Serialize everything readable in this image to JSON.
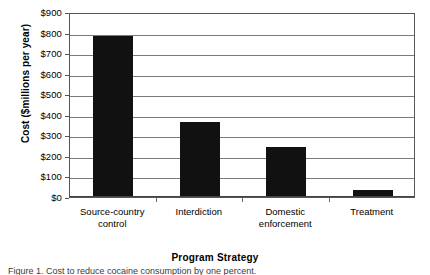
{
  "chart_data": {
    "type": "bar",
    "title": "",
    "xlabel": "Program Strategy",
    "ylabel": "Cost ($millions per year)",
    "categories": [
      "Source-country\ncontrol",
      "Interdiction",
      "Domestic\nenforcement",
      "Treatment"
    ],
    "category_labels_flat": [
      "Source-country control",
      "Interdiction",
      "Domestic enforcement",
      "Treatment"
    ],
    "values": [
      785,
      365,
      245,
      35
    ],
    "ylim": [
      0,
      900
    ],
    "ytick_step": 100,
    "ytick_labels": [
      "$0",
      "$100",
      "$200",
      "$300",
      "$400",
      "$500",
      "$600",
      "$700",
      "$800",
      "$900"
    ],
    "ytick_values": [
      0,
      100,
      200,
      300,
      400,
      500,
      600,
      700,
      800,
      900
    ],
    "grid": "horizontal",
    "legend": "none",
    "bar_color": "#111111",
    "frame_color": "#555555",
    "gridline_color": "#7a7a7a",
    "background": "#ffffff"
  },
  "caption": {
    "label": "Figure 1.",
    "text": "Figure 1.   Cost to reduce cocaine consumption by one percent."
  }
}
